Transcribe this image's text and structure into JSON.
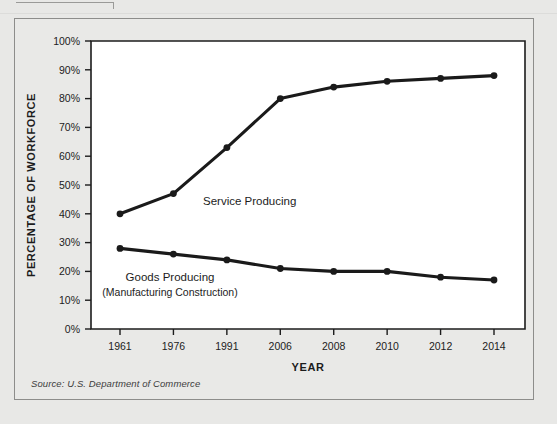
{
  "figure": {
    "source_note": "Source: U.S. Department of Commerce"
  },
  "chart_data": {
    "type": "line",
    "title": "",
    "xlabel": "YEAR",
    "ylabel": "PERCENTAGE OF WORKFORCE",
    "categories": [
      "1961",
      "1976",
      "1991",
      "2006",
      "2008",
      "2010",
      "2012",
      "2014"
    ],
    "ylim": [
      0,
      100
    ],
    "yticks": [
      0,
      10,
      20,
      30,
      40,
      50,
      60,
      70,
      80,
      90,
      100
    ],
    "ytick_labels": [
      "0%",
      "10%",
      "20%",
      "30%",
      "40%",
      "50%",
      "60%",
      "70%",
      "80%",
      "90%",
      "100%"
    ],
    "grid": false,
    "legend_position": "inline-annotation",
    "series": [
      {
        "name": "Service Producing",
        "label": "Service Producing",
        "sublabel": "",
        "color": "#1a1a1a",
        "values": [
          40,
          47,
          63,
          80,
          84,
          86,
          87,
          88
        ]
      },
      {
        "name": "Goods Producing",
        "label": "Goods Producing",
        "sublabel": "(Manufacturing Construction)",
        "color": "#1a1a1a",
        "values": [
          28,
          26,
          24,
          21,
          20,
          20,
          18,
          17
        ]
      }
    ],
    "annotations": [
      {
        "text": "Service Producing",
        "series": "Service Producing"
      },
      {
        "text": "Goods Producing",
        "series": "Goods Producing"
      },
      {
        "text": "(Manufacturing Construction)",
        "series": "Goods Producing"
      }
    ]
  }
}
